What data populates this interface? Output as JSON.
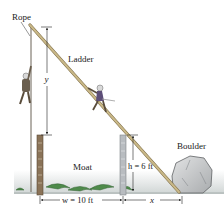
{
  "diagram": {
    "type": "physics-geometry-illustration",
    "labels": {
      "rope": "Rope",
      "ladder": "Ladder",
      "moat": "Moat",
      "boulder": "Boulder",
      "y_var": "y",
      "h_eq": "h = 6 ft",
      "w_eq": "w = 10 ft",
      "x_var": "x"
    },
    "quantities": {
      "h": {
        "symbol": "h",
        "value": 6,
        "unit": "ft"
      },
      "w": {
        "symbol": "w",
        "value": 10,
        "unit": "ft"
      },
      "x": {
        "symbol": "x",
        "value": null
      },
      "y": {
        "symbol": "y",
        "value": null
      }
    },
    "colors": {
      "ladder": "#b9a578",
      "ladder_edge": "#7d6c45",
      "post_left": "#8a7358",
      "post_right": "#b8bcc0",
      "boulder": "#c9cbcd",
      "ground": "#dfe3e2",
      "grass": "#4e8a4a",
      "dimension": "#222222"
    }
  }
}
